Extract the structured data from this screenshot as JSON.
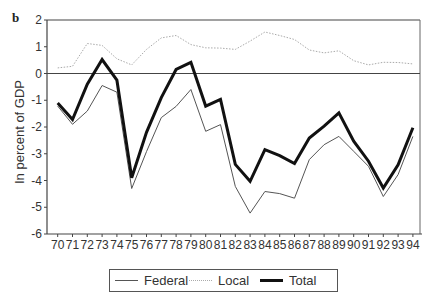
{
  "panel_label": "b",
  "chart_data": {
    "type": "line",
    "title": "",
    "xlabel": "",
    "ylabel": "In percent of GDP",
    "ylim": [
      -6,
      2
    ],
    "yticks": [
      2,
      1,
      0,
      -1,
      -2,
      -3,
      -4,
      -5,
      -6
    ],
    "grid": false,
    "zero_line": true,
    "legend_position": "bottom",
    "x": [
      "70",
      "71",
      "72",
      "73",
      "74",
      "75",
      "76",
      "77",
      "78",
      "79",
      "80",
      "81",
      "82",
      "83",
      "84",
      "85",
      "86",
      "87",
      "88",
      "89",
      "90",
      "91",
      "92",
      "93",
      "94"
    ],
    "series": [
      {
        "name": "Federal",
        "style": "thin-solid",
        "color": "#555555",
        "values": [
          -1.22,
          -1.9,
          -1.4,
          -0.45,
          -0.7,
          -4.3,
          -2.92,
          -1.65,
          -1.23,
          -0.6,
          -2.16,
          -1.91,
          -4.22,
          -5.22,
          -4.41,
          -4.49,
          -4.66,
          -3.22,
          -2.66,
          -2.35,
          -2.91,
          -3.47,
          -4.6,
          -3.78,
          -2.35
        ]
      },
      {
        "name": "Local",
        "style": "dotted",
        "color": "#aaaaaa",
        "values": [
          0.21,
          0.27,
          1.12,
          1.05,
          0.55,
          0.32,
          0.9,
          1.33,
          1.42,
          1.08,
          0.96,
          0.95,
          0.9,
          1.21,
          1.55,
          1.42,
          1.27,
          0.88,
          0.77,
          0.85,
          0.48,
          0.32,
          0.42,
          0.41,
          0.36
        ]
      },
      {
        "name": "Total",
        "style": "thick-solid",
        "color": "#111111",
        "values": [
          -1.1,
          -1.72,
          -0.4,
          0.52,
          -0.25,
          -3.9,
          -2.2,
          -0.9,
          0.15,
          0.42,
          -1.22,
          -0.97,
          -3.4,
          -4.03,
          -2.85,
          -3.07,
          -3.37,
          -2.41,
          -1.97,
          -1.47,
          -2.53,
          -3.28,
          -4.28,
          -3.41,
          -2.03
        ]
      }
    ]
  },
  "legend": {
    "items": [
      {
        "label": "Federal"
      },
      {
        "label": "Local"
      },
      {
        "label": "Total"
      }
    ]
  }
}
